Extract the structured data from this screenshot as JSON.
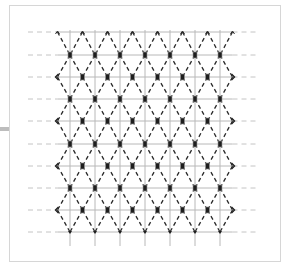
{
  "diagram": {
    "type": "triangular-lattice",
    "colors": {
      "frame": "#d6d6d6",
      "side_tab": "#bdbdbd",
      "grid_line": "#b8b8b8",
      "grid_dash": "#c4c4c4",
      "diagonal": "#2a2a2a",
      "node_fill": "#1e1e1e",
      "node_stroke": "#9a9a9a"
    },
    "columns_x": [
      70,
      95,
      120,
      145,
      170,
      195,
      220
    ],
    "rows_y": [
      32,
      55,
      77,
      99,
      121,
      144,
      166,
      188,
      210,
      232
    ],
    "vertical_span": [
      30,
      246
    ],
    "horizontal_span": [
      28,
      258
    ],
    "node_count_per_full_row": 7,
    "node_count_per_offset_row": 8
  }
}
